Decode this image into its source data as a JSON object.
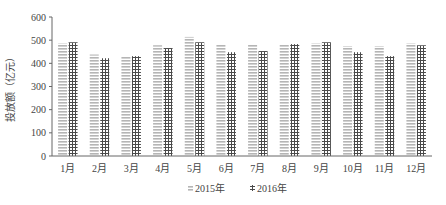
{
  "chart_data": {
    "type": "bar",
    "title": "",
    "xlabel": "",
    "ylabel": "投放额（亿元）",
    "ylim": [
      0,
      600
    ],
    "yticks": [
      0,
      100,
      200,
      300,
      400,
      500,
      600
    ],
    "grid": false,
    "legend_position": "bottom",
    "categories": [
      "1月",
      "2月",
      "3月",
      "4月",
      "5月",
      "6月",
      "7月",
      "8月",
      "9月",
      "10月",
      "11月",
      "12月"
    ],
    "series": [
      {
        "name": "2015年",
        "pattern": "horizontal-lines",
        "color": "#b8b8b8",
        "values": [
          486,
          438,
          431,
          478,
          514,
          483,
          483,
          483,
          486,
          474,
          474,
          486
        ]
      },
      {
        "name": "2016年",
        "pattern": "grid",
        "color": "#555555",
        "values": [
          491,
          422,
          431,
          466,
          491,
          448,
          453,
          483,
          491,
          448,
          431,
          478
        ]
      }
    ]
  }
}
